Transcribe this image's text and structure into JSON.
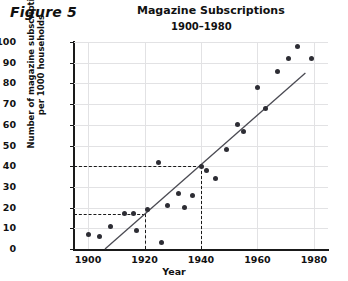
{
  "figure": {
    "label": "Figure 5"
  },
  "chart_data": {
    "type": "scatter",
    "title": "Magazine Subscriptions",
    "subtitle": "1900–1980",
    "xlabel": "Year",
    "ylabel_lines": [
      "Number of magazine subscriptions",
      "per 1000 households"
    ],
    "ylabel": "Number of magazine subscriptions per 1000 households",
    "xlim": [
      1895,
      1985
    ],
    "ylim": [
      0,
      100
    ],
    "xticks": [
      1900,
      1920,
      1940,
      1960,
      1980
    ],
    "yticks": [
      0,
      10,
      20,
      30,
      40,
      50,
      60,
      70,
      80,
      90,
      100
    ],
    "grid": true,
    "legend": null,
    "point_color": "#2d2d34",
    "trend_color": "#4a4a52",
    "points": [
      {
        "x": 1900,
        "y": 7
      },
      {
        "x": 1904,
        "y": 6
      },
      {
        "x": 1908,
        "y": 11
      },
      {
        "x": 1913,
        "y": 17
      },
      {
        "x": 1916,
        "y": 17
      },
      {
        "x": 1917,
        "y": 9
      },
      {
        "x": 1921,
        "y": 19
      },
      {
        "x": 1925,
        "y": 42
      },
      {
        "x": 1926,
        "y": 3
      },
      {
        "x": 1928,
        "y": 21
      },
      {
        "x": 1932,
        "y": 27
      },
      {
        "x": 1934,
        "y": 20
      },
      {
        "x": 1937,
        "y": 26
      },
      {
        "x": 1940,
        "y": 40
      },
      {
        "x": 1942,
        "y": 38
      },
      {
        "x": 1945,
        "y": 34
      },
      {
        "x": 1949,
        "y": 48
      },
      {
        "x": 1953,
        "y": 60
      },
      {
        "x": 1955,
        "y": 57
      },
      {
        "x": 1960,
        "y": 78
      },
      {
        "x": 1963,
        "y": 68
      },
      {
        "x": 1967,
        "y": 86
      },
      {
        "x": 1971,
        "y": 92
      },
      {
        "x": 1974,
        "y": 98
      },
      {
        "x": 1979,
        "y": 92
      }
    ],
    "trend_line": {
      "x1": 1906,
      "y1": 0,
      "x2": 1977,
      "y2": 85
    },
    "reference_lines": [
      {
        "orientation": "horizontal",
        "y": 40,
        "from_x": 1895,
        "to_x": 1940,
        "style": "dashed"
      },
      {
        "orientation": "vertical",
        "x": 1940,
        "from_y": 0,
        "to_y": 40,
        "style": "dashed"
      },
      {
        "orientation": "horizontal",
        "y": 17,
        "from_x": 1895,
        "to_x": 1920,
        "style": "dashed"
      },
      {
        "orientation": "vertical",
        "x": 1920,
        "from_y": 0,
        "to_y": 17,
        "style": "dashed"
      }
    ]
  }
}
